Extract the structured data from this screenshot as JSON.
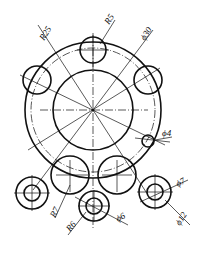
{
  "drawing": {
    "type": "engineering-drawing",
    "dimensions": [
      {
        "id": "r25",
        "text": "R25"
      },
      {
        "id": "r5",
        "text": "R5"
      },
      {
        "id": "d30",
        "text": "ϕ30"
      },
      {
        "id": "d4",
        "text": "ϕ4"
      },
      {
        "id": "d7",
        "text": "ϕ7"
      },
      {
        "id": "d12",
        "text": "ϕ12"
      },
      {
        "id": "r7",
        "text": "R7"
      },
      {
        "id": "r6",
        "text": "R6"
      },
      {
        "id": "d6",
        "text": "ϕ6"
      }
    ]
  }
}
